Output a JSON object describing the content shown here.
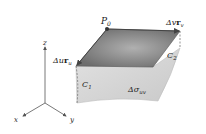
{
  "diagram": {
    "point_label": "P",
    "point_sub": "0",
    "vector_v_label": "Δv",
    "vector_v_bold": "r",
    "vector_v_sub": "v",
    "vector_u_label": "Δu",
    "vector_u_bold": "r",
    "vector_u_sub": "u",
    "curve1_label": "C",
    "curve1_sub": "1",
    "curve2_label": "C",
    "curve2_sub": "2",
    "area_label": "Δσ",
    "area_sub": "uv",
    "axis_x": "x",
    "axis_y": "y",
    "axis_z": "z"
  },
  "colors": {
    "tangent_plane": "#7a7a7a",
    "surface": "#d6d6d6",
    "axes": "#555555"
  }
}
